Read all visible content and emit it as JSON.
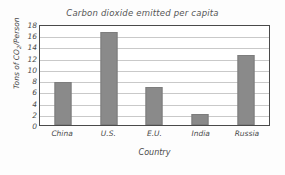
{
  "chart_data": {
    "type": "bar",
    "title": "Carbon dioxide emitted per capita",
    "xlabel": "Country",
    "ylabel": "Tons of CO2/Person",
    "ylabel_prefix": "Tons of CO",
    "ylabel_sub": "2",
    "ylabel_suffix": "/Person",
    "categories": [
      "China",
      "U.S.",
      "E.U.",
      "India",
      "Russia"
    ],
    "values": [
      7.7,
      16.5,
      6.7,
      1.9,
      12.5
    ],
    "ylim": [
      0,
      18
    ],
    "ytick_labels": [
      "18",
      "16",
      "14",
      "12",
      "10",
      "8",
      "6",
      "4",
      "2",
      "0"
    ],
    "ytick_values": [
      18,
      16,
      14,
      12,
      10,
      8,
      6,
      4,
      2,
      0
    ],
    "grid": true,
    "legend": "none",
    "bar_color": "#8a8a8a",
    "grid_color": "#c9c9c9",
    "frame_color": "#4a4a4a",
    "text_color": "#4a4a4a",
    "background": "#ffffff"
  }
}
